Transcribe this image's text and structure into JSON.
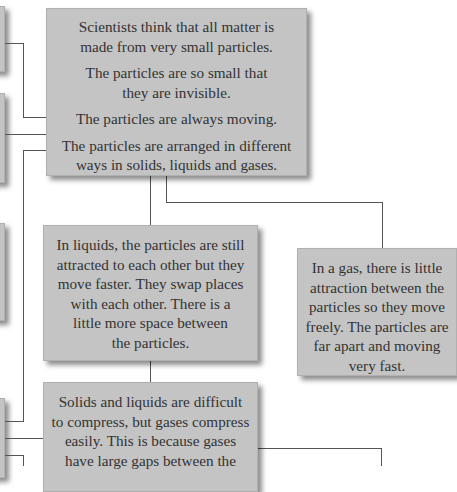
{
  "diagram": {
    "main_box": {
      "paragraphs": [
        "Scientists think that all matter is made from very small particles.",
        "The particles are so small that they are invisible.",
        "The particles are always moving.",
        "The particles are arranged in different ways in solids, liquids and gases."
      ],
      "lines": [
        [
          "Scientists think that all matter is",
          "made from very small particles."
        ],
        [
          "The particles are so small that",
          "they are invisible."
        ],
        [
          "The particles are always moving."
        ],
        [
          "The particles are arranged in different",
          "ways in solids, liquids and gases."
        ]
      ]
    },
    "liquids_box": {
      "lines": [
        "In liquids, the particles are still",
        "attracted to each other but they",
        "move faster. They swap places",
        "with each other. There is a",
        "little more space between",
        "the particles."
      ]
    },
    "gas_box": {
      "lines": [
        "In a gas, there is little",
        "attraction between the",
        "particles so they move",
        "freely. The particles are",
        "far apart and moving",
        "very fast."
      ]
    },
    "compress_box": {
      "lines": [
        "Solids and liquids are difficult",
        "to compress, but gases compress",
        "easily. This is because gases",
        "have large gaps between the"
      ]
    },
    "colors": {
      "box_fill": "#c4c4c4",
      "connector": "#555555",
      "text": "#333333",
      "background": "#ffffff"
    }
  }
}
